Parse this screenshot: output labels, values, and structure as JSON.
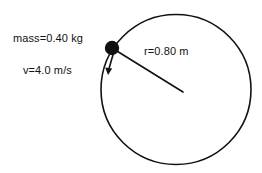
{
  "figure": {
    "kind": "physics-free-body-diagram",
    "background_color": "#ffffff",
    "stroke_color": "#111111"
  },
  "labels": {
    "mass": "mass=0.40 kg",
    "velocity": "v=4.0 m/s",
    "radius": "r=0.80 m"
  },
  "quantities": {
    "mass_value": "0.40",
    "mass_unit": "kg",
    "velocity_value": "4.0",
    "velocity_unit": "m/s",
    "radius_value": "0.80",
    "radius_unit": "m"
  },
  "geometry": {
    "circle": {
      "center_x": 176,
      "center_y": 89.5,
      "radius": 75,
      "stroke_width": 1.6
    },
    "mass_marker": {
      "center_x": 112,
      "center_y": 48,
      "radius": 7,
      "fill": "#111111"
    },
    "radius_line": {
      "x1": 112,
      "y1": 48,
      "x2": 183,
      "y2": 92,
      "stroke_width": 1.6
    },
    "velocity_arrow": {
      "x1": 113,
      "y1": 54,
      "x2": 108,
      "y2": 74,
      "stroke_width": 1.6,
      "head_length": 7,
      "head_width": 5
    }
  }
}
